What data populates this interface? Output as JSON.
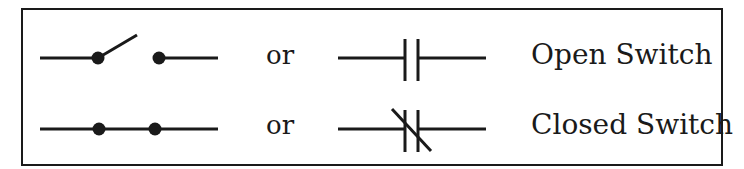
{
  "diagram": {
    "rows": [
      {
        "symbol_a": "switch-open-pivot",
        "connector": "or",
        "symbol_b": "normally-open-contact",
        "label": "Open Switch"
      },
      {
        "symbol_a": "switch-closed-dots",
        "connector": "or",
        "symbol_b": "normally-closed-contact",
        "label": "Closed Switch"
      }
    ],
    "colors": {
      "ink": "#1a1a1a",
      "background": "#ffffff"
    }
  }
}
